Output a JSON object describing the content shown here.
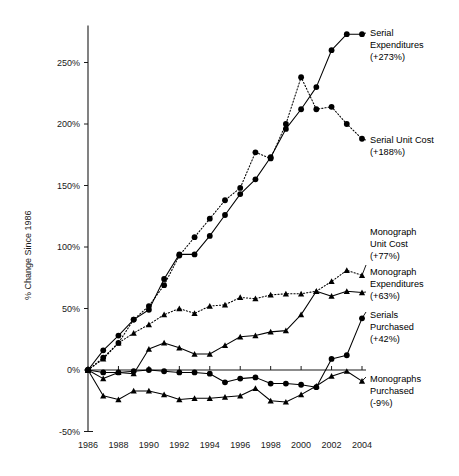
{
  "chart_data": {
    "type": "line",
    "title": "",
    "subtitle": "",
    "xlabel": "",
    "ylabel": "% Change Since 1986",
    "xlim": [
      1986,
      2004
    ],
    "ylim": [
      -50,
      280
    ],
    "grid": false,
    "legend_position": "right-inline-annotations",
    "x": [
      1986,
      1987,
      1988,
      1989,
      1990,
      1991,
      1992,
      1993,
      1994,
      1995,
      1996,
      1997,
      1998,
      1999,
      2000,
      2001,
      2002,
      2003,
      2004
    ],
    "xticks": [
      "1986",
      "1988",
      "1990",
      "1992",
      "1994",
      "1996",
      "1998",
      "2000",
      "2002",
      "2004"
    ],
    "xtick_values": [
      1986,
      1988,
      1990,
      1992,
      1994,
      1996,
      1998,
      2000,
      2002,
      2004
    ],
    "yticks": [
      "-50%",
      "0%",
      "50%",
      "100%",
      "150%",
      "200%",
      "250%"
    ],
    "ytick_values": [
      -50,
      0,
      50,
      100,
      150,
      200,
      250
    ],
    "series": [
      {
        "name": "Serial Expenditures",
        "style": "solid",
        "marker": "circle",
        "final_change": "+273%",
        "label_lines": [
          "Serial",
          "Expenditures",
          "(+273%)"
        ],
        "values": [
          0,
          16,
          28,
          41,
          49,
          74,
          94,
          94,
          109,
          126,
          143,
          155,
          173,
          196,
          212,
          230,
          260,
          273,
          273
        ]
      },
      {
        "name": "Serial Unit Cost",
        "style": "dotted",
        "marker": "circle",
        "final_change": "+188%",
        "label_lines": [
          "Serial Unit Cost",
          "(+188%)"
        ],
        "values": [
          0,
          10,
          22,
          41,
          52,
          69,
          93,
          108,
          123,
          138,
          148,
          177,
          172,
          200,
          238,
          212,
          214,
          200,
          188
        ]
      },
      {
        "name": "Monograph Unit Cost",
        "style": "dotted",
        "marker": "triangle",
        "final_change": "+77%",
        "label_lines": [
          "Monograph",
          "Unit Cost",
          "(+77%)"
        ],
        "values": [
          0,
          9,
          22,
          30,
          37,
          45,
          50,
          46,
          52,
          53,
          59,
          58,
          61,
          62,
          62,
          64,
          72,
          81,
          77
        ]
      },
      {
        "name": "Monograph Expenditures",
        "style": "solid",
        "marker": "triangle",
        "final_change": "+63%",
        "label_lines": [
          "Monograph",
          "Expenditures",
          "(+63%)"
        ],
        "values": [
          0,
          -7,
          -2,
          -3,
          17,
          22,
          18,
          13,
          13,
          20,
          27,
          28,
          31,
          32,
          45,
          64,
          60,
          64,
          63
        ]
      },
      {
        "name": "Serials Purchased",
        "style": "solid",
        "marker": "circle",
        "final_change": "+42%",
        "label_lines": [
          "Serials",
          "Purchased",
          "(+42%)"
        ],
        "values": [
          0,
          -2,
          -2,
          -1,
          0,
          -1,
          -2,
          -2,
          -3,
          -10,
          -7,
          -6,
          -11,
          -11,
          -12,
          -14,
          9,
          12,
          42
        ]
      },
      {
        "name": "Monographs Purchased",
        "style": "solid",
        "marker": "triangle",
        "final_change": "-9%",
        "label_lines": [
          "Monographs",
          "Purchased",
          "(-9%)"
        ],
        "values": [
          0,
          -21,
          -24,
          -17,
          -17,
          -20,
          -24,
          -23,
          -23,
          -22,
          -21,
          -15,
          -25,
          -26,
          -20,
          -13,
          -5,
          -1,
          -9
        ]
      }
    ],
    "annotations": [
      {
        "id": "serial-expenditures",
        "lines": [
          "Serial",
          "Expenditures",
          "(+273%)"
        ]
      },
      {
        "id": "serial-unit-cost",
        "lines": [
          "Serial Unit Cost",
          "(+188%)"
        ]
      },
      {
        "id": "monograph-unit-cost",
        "lines": [
          "Monograph",
          "Unit Cost",
          "(+77%)"
        ]
      },
      {
        "id": "monograph-expenditures",
        "lines": [
          "Monograph",
          "Expenditures",
          "(+63%)"
        ]
      },
      {
        "id": "serials-purchased",
        "lines": [
          "Serials",
          "Purchased",
          "(+42%)"
        ]
      },
      {
        "id": "monographs-purchased",
        "lines": [
          "Monographs",
          "Purchased",
          "(-9%)"
        ]
      }
    ],
    "colors": {
      "line": "#000000",
      "marker": "#000000",
      "axis": "#1a1a1a",
      "background": "#ffffff"
    }
  },
  "axes": {
    "y_title": "% Change Since 1986",
    "y_tick_labels": [
      "250%",
      "200%",
      "150%",
      "100%",
      "50%",
      "0%",
      "-50%"
    ],
    "x_tick_labels": [
      "1986",
      "1988",
      "1990",
      "1992",
      "1994",
      "1996",
      "1998",
      "2000",
      "2002",
      "2004"
    ]
  },
  "annotations": {
    "serial_expenditures": {
      "line1": "Serial",
      "line2": "Expenditures",
      "line3": "(+273%)"
    },
    "serial_unit_cost": {
      "line1": "Serial Unit Cost",
      "line2": "(+188%)"
    },
    "monograph_unit_cost": {
      "line1": "Monograph",
      "line2": "Unit Cost",
      "line3": "(+77%)"
    },
    "monograph_expenditures": {
      "line1": "Monograph",
      "line2": "Expenditures",
      "line3": "(+63%)"
    },
    "serials_purchased": {
      "line1": "Serials",
      "line2": "Purchased",
      "line3": "(+42%)"
    },
    "monographs_purchased": {
      "line1": "Monographs",
      "line2": "Purchased",
      "line3": "(-9%)"
    }
  }
}
